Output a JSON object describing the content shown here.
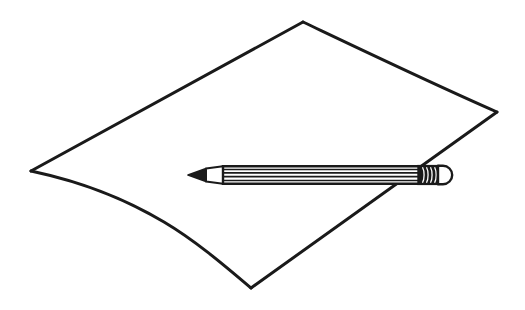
{
  "artwork": {
    "title": "Pencil resting on a sheet of paper",
    "style": "black-and-white line drawing",
    "background_color": "#FFFFFF",
    "stroke_color": "#1A1A1A",
    "canvas": {
      "width": 525,
      "height": 310
    }
  },
  "paper": {
    "label": "sheet of paper",
    "fill_color": "#FFFFFF",
    "outline_color": "#1A1A1A",
    "outline_width": 3,
    "corners": {
      "left": {
        "x": 31,
        "y": 171
      },
      "top": {
        "x": 303,
        "y": 22
      },
      "right": {
        "x": 497,
        "y": 112
      },
      "bottom": {
        "x": 251,
        "y": 288
      }
    },
    "edges": [
      {
        "name": "top-left-edge",
        "from": "left",
        "to": "top",
        "curvature": "straight"
      },
      {
        "name": "top-right-edge",
        "from": "top",
        "to": "right",
        "curvature": "gentle-sag"
      },
      {
        "name": "bottom-right-edge",
        "from": "right",
        "to": "bottom",
        "curvature": "straight"
      },
      {
        "name": "bottom-left-edge",
        "from": "bottom",
        "to": "left",
        "curvature": "wavy"
      }
    ]
  },
  "pencil": {
    "label": "pencil",
    "outline_color": "#1A1A1A",
    "body_color": "#FFFFFF",
    "stripe_color": "#1A1A1A",
    "graphite_color": "#1A1A1A",
    "ferrule_color": "#1A1A1A",
    "eraser_color": "#FFFFFF",
    "axis_y": 175,
    "tip_x": 188,
    "end_x": 451,
    "body_half_height": 8,
    "parts": [
      {
        "name": "graphite-tip",
        "from_x": 188,
        "to_x": 205
      },
      {
        "name": "wood-cone",
        "from_x": 205,
        "to_x": 223
      },
      {
        "name": "barrel",
        "from_x": 223,
        "to_x": 418
      },
      {
        "name": "ferrule",
        "from_x": 418,
        "to_x": 438
      },
      {
        "name": "eraser",
        "from_x": 438,
        "to_x": 451
      }
    ],
    "barrel_facet_lines": 4,
    "ferrule_crimp_lines": 4
  }
}
